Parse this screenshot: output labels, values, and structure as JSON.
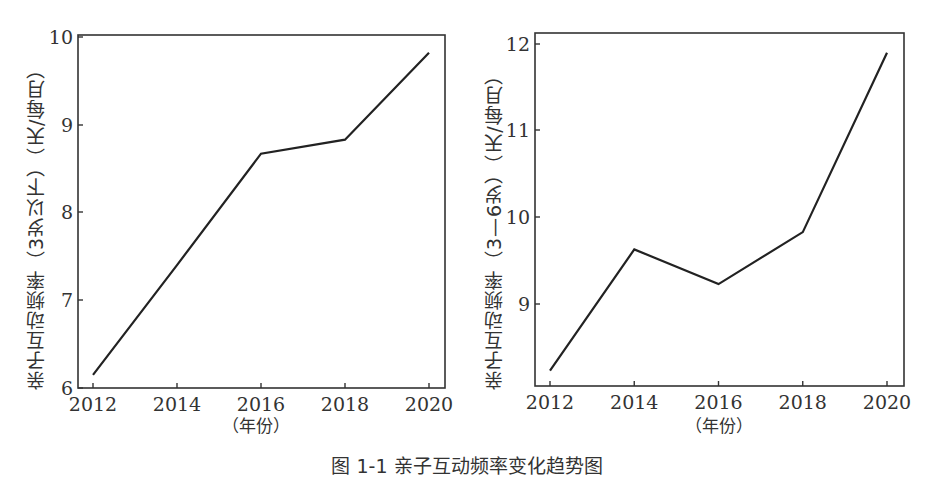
{
  "figure": {
    "caption": "图 1-1 亲子互动频率变化趋势图"
  },
  "chart_data": [
    {
      "type": "line",
      "title": "",
      "xlabel": "（年份）",
      "ylabel": "亲子互动频率（3岁以下）（天/每月）",
      "x": [
        2012,
        2014,
        2016,
        2018,
        2020
      ],
      "values": [
        6.15,
        7.4,
        8.67,
        8.83,
        9.82
      ],
      "xticks": [
        "2012",
        "2014",
        "2016",
        "2018",
        "2020"
      ],
      "yticks": [
        "6",
        "7",
        "8",
        "9",
        "10"
      ],
      "ylim": [
        6,
        10
      ],
      "grid": false,
      "legend": null
    },
    {
      "type": "line",
      "title": "",
      "xlabel": "（年份）",
      "ylabel": "亲子互动频率（3—6岁）（天/每月）",
      "x": [
        2012,
        2014,
        2016,
        2018,
        2020
      ],
      "values": [
        8.23,
        9.63,
        9.23,
        9.83,
        11.9
      ],
      "xticks": [
        "2012",
        "2014",
        "2016",
        "2018",
        "2020"
      ],
      "yticks": [
        "9",
        "10",
        "11",
        "12"
      ],
      "ylim": [
        8.05,
        12.1
      ],
      "grid": false,
      "legend": null
    }
  ],
  "style": {
    "line_color": "#222222",
    "axis_color": "#333333"
  }
}
